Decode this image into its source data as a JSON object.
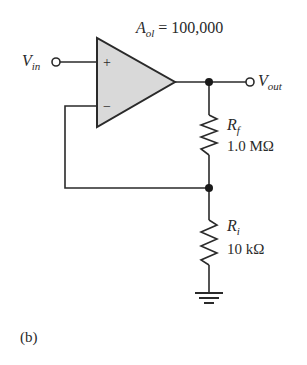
{
  "figure_label": "(b)",
  "op_amp": {
    "gain_symbol": "A",
    "gain_subscript": "ol",
    "gain_equals": " = 100,000",
    "plus_sign": "+",
    "minus_sign": "−",
    "fill_color": "#d9d9d9"
  },
  "input": {
    "symbol": "V",
    "subscript": "in"
  },
  "output": {
    "symbol": "V",
    "subscript": "out"
  },
  "feedback_resistor": {
    "symbol": "R",
    "subscript": "f",
    "value": "1.0 MΩ"
  },
  "input_resistor": {
    "symbol": "R",
    "subscript": "i",
    "value": "10 kΩ"
  },
  "colors": {
    "wire": "#2a2a2a",
    "background": "#ffffff"
  }
}
